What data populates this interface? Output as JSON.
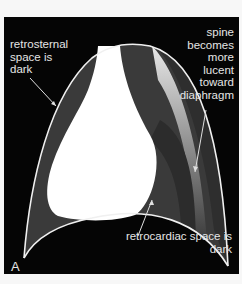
{
  "figure": {
    "panel_label": "A",
    "annotations": {
      "retrosternal": [
        "retrosternal",
        "space is",
        "dark"
      ],
      "spine": [
        "spine",
        "becomes",
        "more",
        "lucent",
        "toward",
        "diaphragm"
      ],
      "retrocardiac": [
        "retrocardiac space is",
        "dark"
      ]
    },
    "colors": {
      "background": "#050505",
      "lung_dark": "#3a3a3a",
      "heart": "#ffffff",
      "outline": "#f0f0f0",
      "label_text": "#e6e6e6"
    }
  }
}
